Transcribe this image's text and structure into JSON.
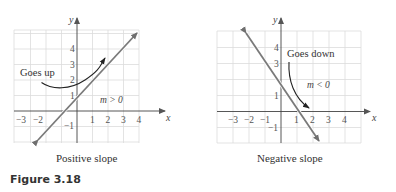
{
  "figure_label": "Figure 3.18",
  "graphs": [
    {
      "caption": "Positive slope",
      "x_label": "x",
      "y_label": "y",
      "x_ticks": [
        "−3",
        "−2",
        "1",
        "2",
        "3",
        "4"
      ],
      "y_ticks": [
        "4",
        "3",
        "2",
        "1",
        "−1"
      ],
      "annotation": "Goes up",
      "slope_label": "m > 0",
      "line_color": "#7a7a7a"
    },
    {
      "caption": "Negative slope",
      "x_label": "x",
      "y_label": "y",
      "x_ticks": [
        "−3",
        "−2",
        "−1",
        "1",
        "2",
        "3",
        "4"
      ],
      "y_ticks": [
        "4",
        "3",
        "1",
        "−1"
      ],
      "annotation": "Goes down",
      "slope_label": "m < 0",
      "line_color": "#7a7a7a"
    }
  ]
}
